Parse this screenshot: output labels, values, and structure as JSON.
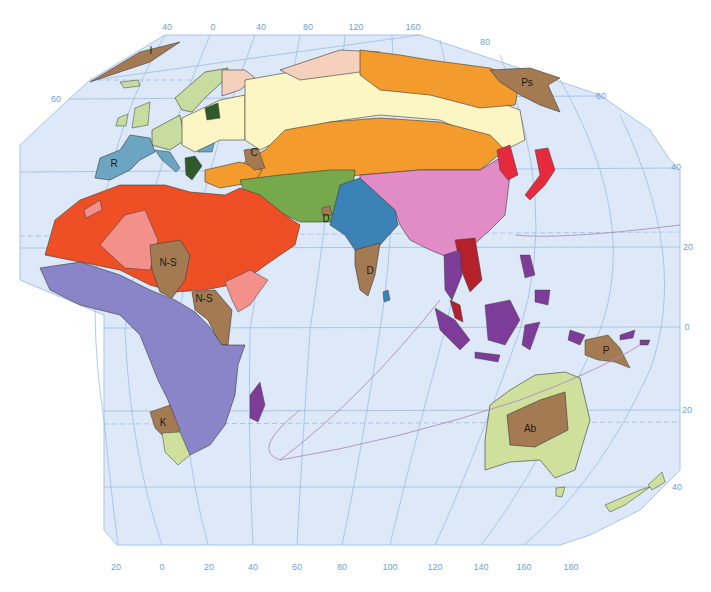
{
  "map": {
    "title": "Language families of the Eastern Hemisphere",
    "colors": {
      "ocean": "#dde9f8",
      "graticule": "#9dbde6",
      "tick_label": "#6f9fd8",
      "border": "#3a3a3a",
      "indo_european_uralic_light": "#fbf6c4",
      "uralic_pink": "#f5d0bc",
      "germanic_green": "#c8dca0",
      "romance_blue": "#6ba5c2",
      "slavic_dark_green": "#2f5a2c",
      "altaic_orange": "#f39b2c",
      "afro_asiatic_red": "#ef4f24",
      "afro_asiatic_salmon": "#f3908a",
      "niger_congo_purple": "#8a84c9",
      "austronesian_violet": "#7d3c98",
      "sino_tibetan_pink": "#e18cc6",
      "indo_iranian_green": "#76a94c",
      "indo_aryan_blue": "#3b82b7",
      "japanese_korean_red": "#e42a3c",
      "austroasiatic_darkred": "#b4212c",
      "isolate_brown": "#a47a52",
      "australian_green": "#cfdf9c"
    },
    "top_ticks": [
      {
        "label": "40",
        "x": 167,
        "y": 27
      },
      {
        "label": "0",
        "x": 213,
        "y": 27
      },
      {
        "label": "40",
        "x": 261,
        "y": 27
      },
      {
        "label": "80",
        "x": 308,
        "y": 27
      },
      {
        "label": "120",
        "x": 356,
        "y": 27
      },
      {
        "label": "160",
        "x": 413,
        "y": 27
      },
      {
        "label": "80",
        "x": 485,
        "y": 42
      }
    ],
    "left_ticks": [
      {
        "label": "60",
        "x": 56,
        "y": 99
      }
    ],
    "right_ticks": [
      {
        "label": "60",
        "x": 601,
        "y": 96
      },
      {
        "label": "40",
        "x": 676,
        "y": 167
      },
      {
        "label": "20",
        "x": 688,
        "y": 247
      },
      {
        "label": "0",
        "x": 687,
        "y": 327
      },
      {
        "label": "20",
        "x": 687,
        "y": 410
      },
      {
        "label": "40",
        "x": 677,
        "y": 487
      }
    ],
    "bottom_ticks": [
      {
        "label": "20",
        "x": 116,
        "y": 567
      },
      {
        "label": "0",
        "x": 162,
        "y": 567
      },
      {
        "label": "20",
        "x": 209,
        "y": 567
      },
      {
        "label": "40",
        "x": 253,
        "y": 567
      },
      {
        "label": "60",
        "x": 297,
        "y": 567
      },
      {
        "label": "80",
        "x": 342,
        "y": 567
      },
      {
        "label": "100",
        "x": 390,
        "y": 567
      },
      {
        "label": "120",
        "x": 435,
        "y": 567
      },
      {
        "label": "140",
        "x": 481,
        "y": 567
      },
      {
        "label": "160",
        "x": 524,
        "y": 567
      },
      {
        "label": "180",
        "x": 571,
        "y": 567
      }
    ],
    "region_labels": [
      {
        "code": "I",
        "x": 151,
        "y": 50
      },
      {
        "code": "R",
        "x": 114,
        "y": 163
      },
      {
        "code": "C",
        "x": 254,
        "y": 152
      },
      {
        "code": "D",
        "x": 326,
        "y": 218
      },
      {
        "code": "D",
        "x": 370,
        "y": 270
      },
      {
        "code": "Ps",
        "x": 527,
        "y": 82
      },
      {
        "code": "N-S",
        "x": 168,
        "y": 262
      },
      {
        "code": "N-S",
        "x": 204,
        "y": 298
      },
      {
        "code": "K",
        "x": 163,
        "y": 422
      },
      {
        "code": "P",
        "x": 606,
        "y": 350
      },
      {
        "code": "Ab",
        "x": 530,
        "y": 428
      }
    ]
  }
}
